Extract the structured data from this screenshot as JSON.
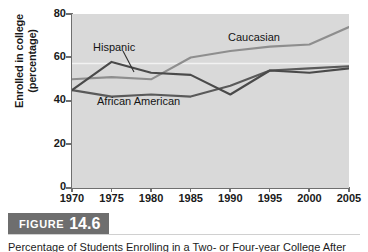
{
  "figure": {
    "label_word": "FIGURE",
    "number": "14.6",
    "caption": "Percentage of Students Enrolling in a Two- or Four-year College After High School"
  },
  "chart_data": {
    "type": "line",
    "title": "",
    "xlabel": "",
    "ylabel": "Enrolled in college (percentage)",
    "ylabel_line1": "Enrolled in college",
    "ylabel_line2": "(percentage)",
    "x": [
      1970,
      1975,
      1980,
      1985,
      1990,
      1995,
      2000,
      2005
    ],
    "xtick_labels": [
      "1970",
      "1975",
      "1980",
      "1985",
      "1990",
      "1995",
      "2000",
      "2005"
    ],
    "ytick_labels": [
      "0",
      "20",
      "40",
      "60",
      "80"
    ],
    "yticks": [
      0,
      20,
      40,
      60,
      80
    ],
    "ylim": [
      0,
      80
    ],
    "xlim": [
      1970,
      2005
    ],
    "grid": false,
    "legend_position": "inline-annotations",
    "plot_background": "#d9d9d9",
    "series": [
      {
        "name": "Caucasian",
        "color": "#8e8e8e",
        "values": [
          50,
          51,
          50,
          60,
          63,
          65,
          66,
          74
        ]
      },
      {
        "name": "Hispanic",
        "color": "#4a4a4a",
        "values": [
          45,
          58,
          53,
          52,
          43,
          54,
          53,
          55
        ]
      },
      {
        "name": "African American",
        "color": "#5a5a5a",
        "values": [
          45,
          42,
          43,
          42,
          47,
          54,
          55,
          56
        ]
      }
    ],
    "annotations": [
      {
        "text": "Hispanic",
        "x": 1972.8,
        "y": 66
      },
      {
        "text": "African American",
        "x": 1973.2,
        "y": 37
      },
      {
        "text": "Caucasian",
        "x": 1990.5,
        "y": 70
      }
    ]
  }
}
